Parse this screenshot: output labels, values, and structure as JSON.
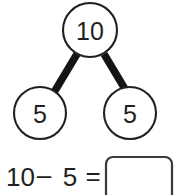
{
  "worksheet": {
    "title": "Number bond subtraction problem",
    "background_color": "#ffffff",
    "ink_color": "#231f20",
    "link_color": "#141414"
  },
  "number_bond": {
    "whole": {
      "label": "whole-circle",
      "value": "10"
    },
    "parts": [
      {
        "label": "part-circle-left",
        "value": "5"
      },
      {
        "label": "part-circle-right",
        "value": "5"
      }
    ]
  },
  "equation": {
    "minuend": "10",
    "operator": "–",
    "subtrahend": "5",
    "equals": "=",
    "answer_value": "",
    "answer_placeholder": ""
  },
  "icons": {
    "circle": "circle-icon",
    "connector": "line-connector-icon",
    "answer_box": "answer-box-icon"
  }
}
